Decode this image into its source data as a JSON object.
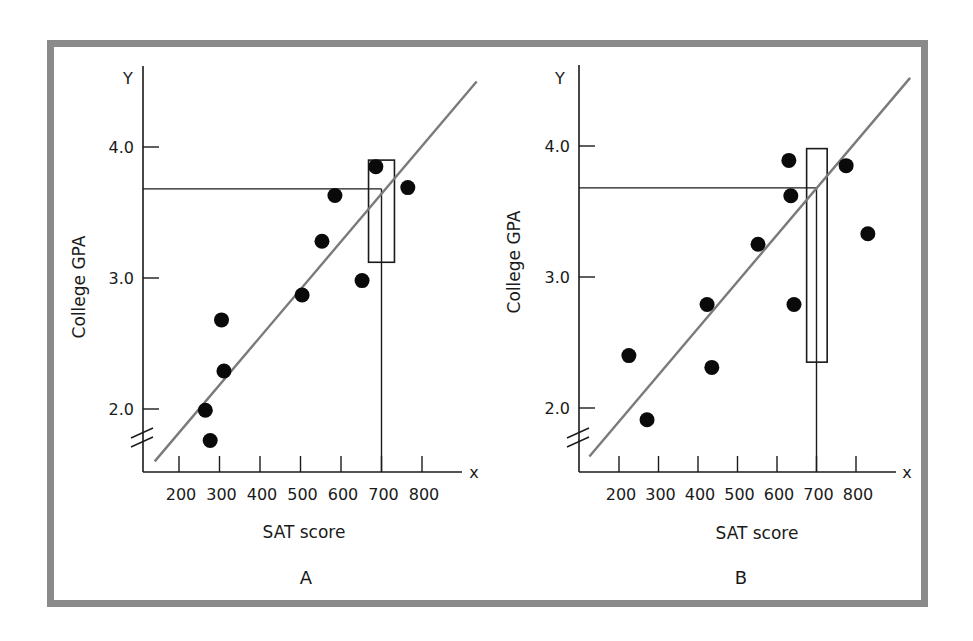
{
  "chart_data": [
    {
      "type": "scatter",
      "panel": "A",
      "title": "A",
      "xlabel": "SAT score",
      "ylabel": "College GPA",
      "x_axis_letter": "x",
      "y_axis_letter": "Y",
      "x_ticks": [
        200,
        300,
        400,
        500,
        600,
        700,
        800
      ],
      "x_tick_labels": [
        "200",
        "300",
        "400",
        "500",
        "600",
        "700",
        "800"
      ],
      "y_ticks": [
        2.0,
        3.0,
        4.0
      ],
      "y_tick_labels": [
        "2.0",
        "3.0",
        "4.0"
      ],
      "axis_break": true,
      "grid": false,
      "points": [
        {
          "x": 265,
          "y": 1.99
        },
        {
          "x": 277,
          "y": 1.76
        },
        {
          "x": 305,
          "y": 2.68
        },
        {
          "x": 311,
          "y": 2.29
        },
        {
          "x": 504,
          "y": 2.87
        },
        {
          "x": 553,
          "y": 3.28
        },
        {
          "x": 585,
          "y": 3.63
        },
        {
          "x": 652,
          "y": 2.98
        },
        {
          "x": 686,
          "y": 3.85
        },
        {
          "x": 765,
          "y": 3.69
        }
      ],
      "regression_line": {
        "x_start": 140,
        "y_start": 1.6,
        "x_end": 935,
        "y_end": 4.5
      },
      "prediction": {
        "x": 700,
        "y": 3.68
      },
      "interval_box": {
        "x_min": 668,
        "x_max": 732,
        "y_min": 3.12,
        "y_max": 3.9
      }
    },
    {
      "type": "scatter",
      "panel": "B",
      "title": "B",
      "xlabel": "SAT score",
      "ylabel": "College GPA",
      "x_axis_letter": "x",
      "y_axis_letter": "Y",
      "x_ticks": [
        200,
        300,
        400,
        500,
        600,
        700,
        800
      ],
      "x_tick_labels": [
        "200",
        "300",
        "400",
        "500",
        "600",
        "700",
        "800"
      ],
      "y_ticks": [
        2.0,
        3.0,
        4.0
      ],
      "y_tick_labels": [
        "2.0",
        "3.0",
        "4.0"
      ],
      "axis_break": true,
      "grid": false,
      "points": [
        {
          "x": 225,
          "y": 2.4
        },
        {
          "x": 271,
          "y": 1.91
        },
        {
          "x": 423,
          "y": 2.79
        },
        {
          "x": 435,
          "y": 2.31
        },
        {
          "x": 552,
          "y": 3.25
        },
        {
          "x": 630,
          "y": 3.89
        },
        {
          "x": 635,
          "y": 3.62
        },
        {
          "x": 643,
          "y": 2.79
        },
        {
          "x": 775,
          "y": 3.85
        },
        {
          "x": 830,
          "y": 3.33
        }
      ],
      "regression_line": {
        "x_start": 125,
        "y_start": 1.63,
        "x_end": 937,
        "y_end": 4.52
      },
      "prediction": {
        "x": 700,
        "y": 3.68
      },
      "interval_box": {
        "x_min": 675,
        "x_max": 727,
        "y_min": 2.35,
        "y_max": 3.98
      }
    }
  ],
  "panels": {
    "A": {
      "label": "A",
      "xlabel": "SAT score",
      "ylabel": "College GPA"
    },
    "B": {
      "label": "B",
      "xlabel": "SAT score",
      "ylabel": "College GPA"
    }
  },
  "colors": {
    "frame": "#8a8a8a",
    "axis": "#1a1a1a",
    "regression_line": "#7a7a7a",
    "points": "#0a0a0a"
  }
}
